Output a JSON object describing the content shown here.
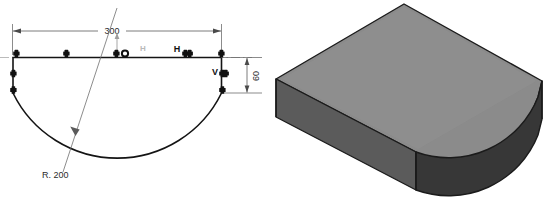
{
  "figure": {
    "type": "cad-sketch-and-solid",
    "background_color": "#ffffff"
  },
  "sketch": {
    "title": "constrained profile sketch",
    "geometry_color": "#1a1a1a",
    "dimension_color": "#555555",
    "centerline_color": "#9a9a9a",
    "dimensions": [
      {
        "name": "overall-width",
        "label": "300",
        "orientation": "horizontal",
        "value": 300
      },
      {
        "name": "side-height",
        "label": "60",
        "orientation": "vertical",
        "value": 60
      },
      {
        "name": "arc-radius",
        "label": "R. 200",
        "orientation": "leader",
        "value": 200
      }
    ],
    "constraints": [
      {
        "name": "horizontal-constraint-faint",
        "label": "H",
        "style": "faint"
      },
      {
        "name": "horizontal-constraint",
        "label": "H",
        "style": "bold"
      },
      {
        "name": "vertical-constraint",
        "label": "V",
        "style": "bold"
      }
    ],
    "point_markers": {
      "name": "sketch-point",
      "count": 9,
      "color": "#111111"
    },
    "midpoint_marker": {
      "name": "midpoint-marker",
      "fill": "#ffffff",
      "stroke": "#111111"
    }
  },
  "solid": {
    "title": "extruded solid preview",
    "shading": {
      "top_face": "#8b8b8b",
      "left_face": "#5b5b5b",
      "right_face": "#3c3c3c",
      "curved_face": "#343434",
      "edge_color": "#1b1b1b"
    }
  },
  "caption": {
    "text": ""
  }
}
